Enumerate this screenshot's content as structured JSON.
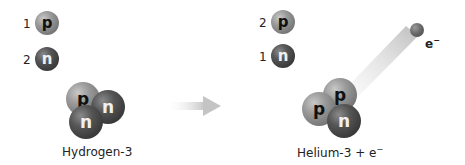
{
  "left_legend": [
    {
      "count": "1",
      "particle": "p",
      "type": "proton"
    },
    {
      "count": "2",
      "particle": "n",
      "type": "neutron"
    }
  ],
  "right_legend": [
    {
      "count": "2",
      "particle": "p",
      "type": "proton"
    },
    {
      "count": "1",
      "particle": "n",
      "type": "neutron"
    }
  ],
  "reactant": {
    "label": "Hydrogen-3",
    "particles": [
      "p",
      "n",
      "n"
    ]
  },
  "product": {
    "label": "Helium-3 + e",
    "label_superscript": "−",
    "particles": [
      "p",
      "p",
      "n"
    ]
  },
  "electron": {
    "symbol": "e",
    "superscript": "−"
  },
  "arrow": {
    "direction": "right",
    "color": "#c8c8c8"
  }
}
